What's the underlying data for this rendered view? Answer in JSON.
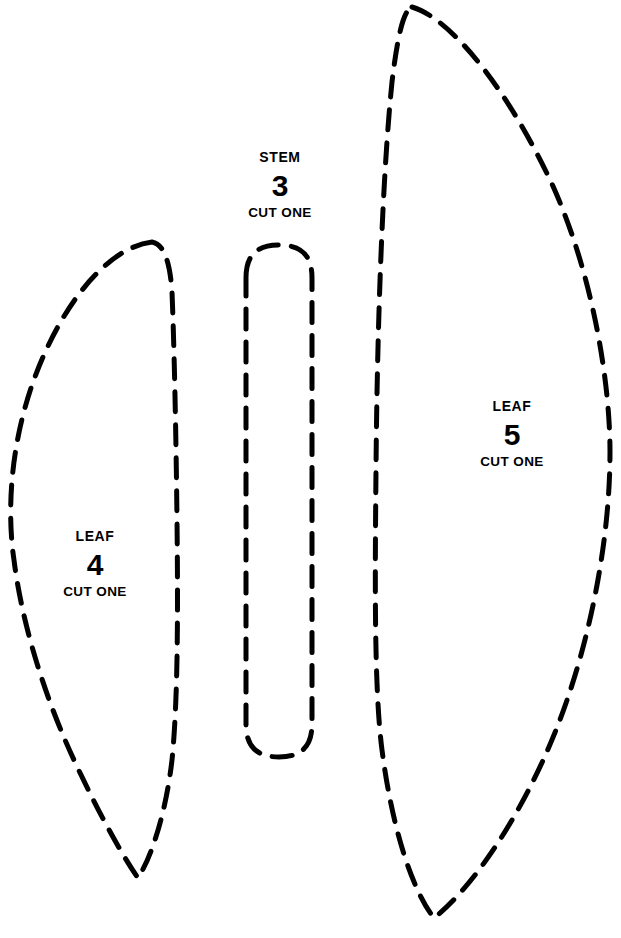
{
  "document": {
    "background_color": "#ffffff",
    "line_color": "#000000",
    "width": 621,
    "height": 938,
    "type": "craft-pattern-template"
  },
  "pieces": [
    {
      "id": "leaf-4",
      "kind": "LEAF",
      "number": "4",
      "instruction": "CUT ONE",
      "outline_path": "M 152 242 C 110 247 62 300 32 385 C 8 455 8 520 14 560 C 22 625 46 700 74 760 C 100 816 124 858 138 878 C 152 856 166 812 172 760 C 178 700 178 610 177 520 C 176 430 174 340 172 292 C 170 262 164 244 152 242 Z"
    },
    {
      "id": "stem-3",
      "kind": "STEM",
      "number": "3",
      "instruction": "CUT ONE",
      "outline_path": "M 246 278 C 246 256 256 245 279 245 C 302 245 312 256 312 278 L 312 724 C 312 746 302 757 279 757 C 256 757 246 746 246 724 Z"
    },
    {
      "id": "leaf-5",
      "kind": "LEAF",
      "number": "5",
      "instruction": "CUT ONE",
      "outline_path": "M 412 7 C 450 18 506 86 552 184 C 592 272 610 380 610 452 C 610 540 590 644 556 730 C 520 820 470 890 434 918 C 412 890 392 828 382 750 C 374 688 375 580 376 470 C 377 340 382 180 392 82 C 398 32 404 10 412 7 Z"
    }
  ]
}
